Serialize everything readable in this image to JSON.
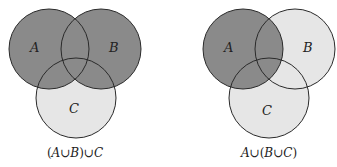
{
  "colors": {
    "shaded": "#8a8a8a",
    "unshaded": "#e6e6e6",
    "stroke": "#2a2a2a",
    "background": "#ffffff"
  },
  "diagrams": [
    {
      "caption": "(A∪B)∪C",
      "caption_parts": [
        "(",
        "A",
        "∪",
        "B",
        ")∪",
        "C"
      ],
      "circles": [
        {
          "label": "A",
          "cx": 49,
          "cy": 49,
          "r": 40,
          "shaded": true
        },
        {
          "label": "B",
          "cx": 101,
          "cy": 49,
          "r": 40,
          "shaded": true
        },
        {
          "label": "C",
          "cx": 76,
          "cy": 98,
          "r": 40,
          "shaded": false
        }
      ],
      "shaded_region": "A∪B (then union with C shown lighter)"
    },
    {
      "caption": "A∪(B∪C)",
      "caption_parts": [
        "A",
        "∪(",
        "B",
        "∪",
        "C",
        ")"
      ],
      "circles": [
        {
          "label": "A",
          "cx": 243,
          "cy": 49,
          "r": 40,
          "shaded": true
        },
        {
          "label": "B",
          "cx": 295,
          "cy": 49,
          "r": 40,
          "shaded": false
        },
        {
          "label": "C",
          "cx": 269,
          "cy": 98,
          "r": 40,
          "shaded": false
        }
      ],
      "shaded_region": "A (B∪C shown lighter)"
    }
  ],
  "labels": {
    "left": {
      "A": "A",
      "B": "B",
      "C": "C"
    },
    "right": {
      "A": "A",
      "B": "B",
      "C": "C"
    }
  }
}
